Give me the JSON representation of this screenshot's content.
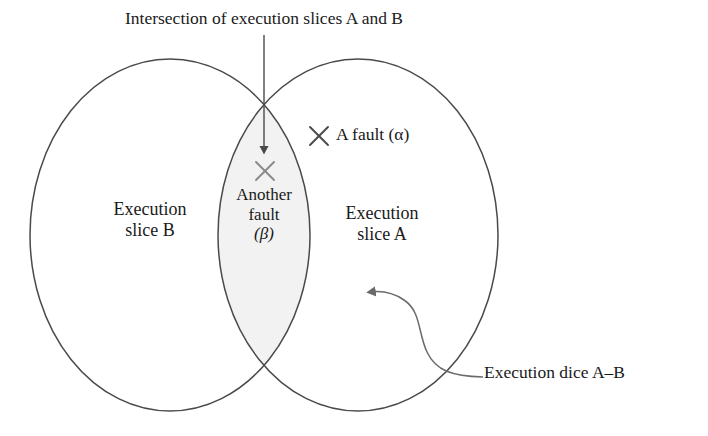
{
  "figure": {
    "type": "venn-diagram",
    "background_color": "#ffffff",
    "stroke_color": "#4a4a4a",
    "text_color": "#1a1a1a",
    "intersection_fill": "#f2f2f2",
    "marker_color": "#808080"
  },
  "title": {
    "text": "Intersection of execution slices A and B"
  },
  "sets": {
    "left": {
      "line1": "Execution",
      "line2": "slice B",
      "name": "Execution slice B"
    },
    "right": {
      "line1": "Execution",
      "line2": "slice A",
      "name": "Execution slice A"
    },
    "intersection": {
      "line1": "Another",
      "line2": "fault",
      "line3": "(β)",
      "name": "Another fault (β)"
    }
  },
  "faults": {
    "a_fault": {
      "marker": "×",
      "label": "A fault (α)"
    },
    "another_fault": {
      "marker": "×",
      "label": "Another fault (β)"
    }
  },
  "annotations": {
    "dice": {
      "text": "Execution dice A–B"
    }
  }
}
